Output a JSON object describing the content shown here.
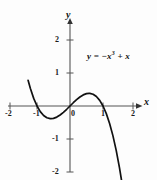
{
  "figure": {
    "equation_label": "y = −x",
    "equation_exponent": "3",
    "equation_tail": " + x",
    "stroke_color": "#111111",
    "axis_color": "#555555",
    "background_color": "#fdfdfd"
  },
  "axes": {
    "x_axis_name": "x",
    "y_axis_name": "y",
    "x_ticks": [
      "-2",
      "-1",
      "0",
      "1",
      "2"
    ],
    "y_ticks": [
      "2",
      "1",
      "-1",
      "-2"
    ]
  },
  "chart_data": {
    "type": "line",
    "title": "",
    "subtitle": "",
    "xlabel": "x",
    "ylabel": "y",
    "annotations": [
      "y = -x^3 + x"
    ],
    "legend": [],
    "legend_position": "none",
    "grid": false,
    "xlim": [
      -2,
      2
    ],
    "ylim": [
      -2,
      2
    ],
    "xticks": [
      -2,
      -1,
      0,
      1,
      2
    ],
    "yticks": [
      -2,
      -1,
      1,
      2
    ],
    "origin_px": [
      70,
      106
    ],
    "unit_px": [
      33,
      33
    ],
    "series": [
      {
        "name": "y = -x^3 + x",
        "equation": "y = -x**3 + x",
        "x_range": [
          -1.27,
          1.58
        ],
        "roots": [
          -1,
          0,
          1
        ],
        "local_minimum": [
          -0.5774,
          -0.3849
        ],
        "local_maximum": [
          0.5774,
          0.3849
        ],
        "x": [
          -1.27,
          -1.2,
          -1.1,
          -1.0,
          -0.9,
          -0.8,
          -0.7,
          -0.6,
          -0.5774,
          -0.5,
          -0.4,
          -0.3,
          -0.2,
          -0.1,
          0.0,
          0.1,
          0.2,
          0.3,
          0.4,
          0.5,
          0.5774,
          0.6,
          0.7,
          0.8,
          0.9,
          1.0,
          1.1,
          1.2,
          1.3,
          1.4,
          1.5,
          1.58
        ],
        "y": [
          0.778,
          0.528,
          0.231,
          0.0,
          -0.171,
          -0.288,
          -0.357,
          -0.384,
          -0.385,
          -0.375,
          -0.336,
          -0.273,
          -0.192,
          -0.099,
          0.0,
          0.099,
          0.192,
          0.273,
          0.336,
          0.375,
          0.385,
          0.384,
          0.357,
          0.288,
          0.171,
          0.0,
          -0.231,
          -0.528,
          -0.897,
          -1.344,
          -1.875,
          -2.364
        ]
      }
    ]
  }
}
